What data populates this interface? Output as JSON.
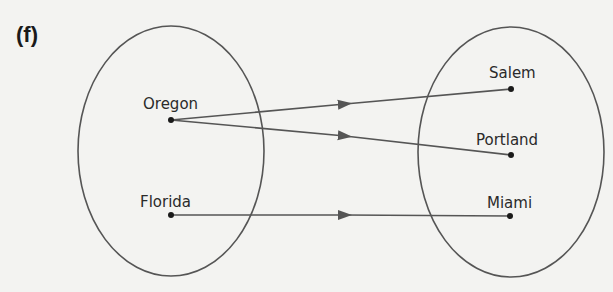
{
  "diagram": {
    "panel_label": "(f)",
    "domain_set": {
      "name": "domain",
      "elements": [
        {
          "label": "Oregon",
          "x": 171,
          "y": 120
        },
        {
          "label": "Florida",
          "x": 171,
          "y": 215
        }
      ]
    },
    "codomain_set": {
      "name": "codomain",
      "elements": [
        {
          "label": "Salem",
          "x": 511,
          "y": 89
        },
        {
          "label": "Portland",
          "x": 511,
          "y": 155
        },
        {
          "label": "Miami",
          "x": 510,
          "y": 216
        }
      ]
    },
    "mappings": [
      {
        "from": "Oregon",
        "to": "Salem"
      },
      {
        "from": "Oregon",
        "to": "Portland"
      },
      {
        "from": "Florida",
        "to": "Miami"
      }
    ],
    "colors": {
      "stroke": "#555555",
      "background": "#f3f3f1",
      "text": "#2a2a2a"
    }
  }
}
